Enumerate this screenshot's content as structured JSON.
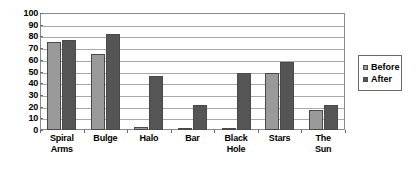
{
  "chart_data": {
    "type": "bar",
    "title": "",
    "subtitle": "",
    "xlabel": "",
    "ylabel": "",
    "ylim": [
      0,
      100
    ],
    "ytick_step": 10,
    "yticks": [
      100,
      90,
      80,
      70,
      60,
      50,
      40,
      30,
      20,
      10,
      0
    ],
    "grid": true,
    "legend_position": "right",
    "categories": [
      "Spiral Arms",
      "Bulge",
      "Halo",
      "Bar",
      "Black Hole",
      "Stars",
      "The Sun"
    ],
    "category_lines": [
      [
        "Spiral",
        "Arms"
      ],
      [
        "Bulge"
      ],
      [
        "Halo"
      ],
      [
        "Bar"
      ],
      [
        "Black",
        "Hole"
      ],
      [
        "Stars"
      ],
      [
        "The",
        "Sun"
      ]
    ],
    "series": [
      {
        "name": "Before",
        "color": "#9a9a9a",
        "values": [
          75,
          65,
          3,
          1,
          2,
          49,
          17
        ]
      },
      {
        "name": "After",
        "color": "#555555",
        "values": [
          77,
          82,
          46,
          21,
          49,
          58,
          21
        ]
      }
    ]
  },
  "legend": {
    "entries": [
      {
        "label": "Before"
      },
      {
        "label": "After"
      }
    ]
  },
  "colors": {
    "before": "#9a9a9a",
    "after": "#555555",
    "gridline": "#a9a9a9",
    "frame": "#8a8a8a",
    "background": "#ffffff",
    "text": "#000000"
  }
}
